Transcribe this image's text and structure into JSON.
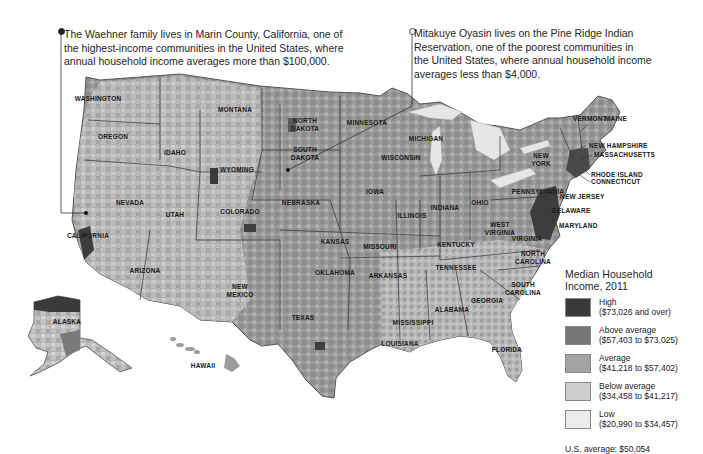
{
  "callouts": {
    "left": {
      "lines": [
        "The Waehner family lives in Marin County, California, one of",
        "the highest-income communities in the United States, where",
        "annual household income averages more than $100,000."
      ],
      "marker": "filled-dot"
    },
    "right": {
      "lines": [
        "Mitakuye Oyasin lives on the Pine Ridge Indian",
        "Reservation, one of the poorest communities in",
        "the United States, where annual household income",
        "averages less than $4,000."
      ],
      "marker": "hollow-dot"
    }
  },
  "map": {
    "states": [
      {
        "name": "WASHINGTON",
        "x": 98,
        "y": 101
      },
      {
        "name": "OREGON",
        "x": 113,
        "y": 139
      },
      {
        "name": "IDAHO",
        "x": 175,
        "y": 155
      },
      {
        "name": "MONTANA",
        "x": 235,
        "y": 112
      },
      {
        "name": "WYOMING",
        "x": 237,
        "y": 172
      },
      {
        "name": "NORTH",
        "x": 305,
        "y": 123
      },
      {
        "name": "DAKOTA",
        "x": 305,
        "y": 131
      },
      {
        "name": "SOUTH",
        "x": 305,
        "y": 152
      },
      {
        "name": "DAKOTA",
        "x": 305,
        "y": 160
      },
      {
        "name": "MINNESOTA",
        "x": 367,
        "y": 125
      },
      {
        "name": "WISCONSIN",
        "x": 401,
        "y": 160
      },
      {
        "name": "MICHIGAN",
        "x": 426,
        "y": 141
      },
      {
        "name": "IOWA",
        "x": 375,
        "y": 194
      },
      {
        "name": "NEBRASKA",
        "x": 301,
        "y": 205
      },
      {
        "name": "NEVADA",
        "x": 130,
        "y": 205
      },
      {
        "name": "UTAH",
        "x": 175,
        "y": 217
      },
      {
        "name": "COLORADO",
        "x": 240,
        "y": 214
      },
      {
        "name": "CALIFORNIA",
        "x": 88,
        "y": 238
      },
      {
        "name": "ILLINOIS",
        "x": 412,
        "y": 218
      },
      {
        "name": "INDIANA",
        "x": 445,
        "y": 210
      },
      {
        "name": "OHIO",
        "x": 480,
        "y": 205
      },
      {
        "name": "KANSAS",
        "x": 335,
        "y": 244
      },
      {
        "name": "MISSOURI",
        "x": 380,
        "y": 249
      },
      {
        "name": "KENTUCKY",
        "x": 456,
        "y": 247
      },
      {
        "name": "WEST",
        "x": 500,
        "y": 227
      },
      {
        "name": "VIRGINIA",
        "x": 500,
        "y": 235
      },
      {
        "name": "VIRGINIA",
        "x": 527,
        "y": 241
      },
      {
        "name": "ARIZONA",
        "x": 145,
        "y": 273
      },
      {
        "name": "OKLAHOMA",
        "x": 335,
        "y": 275
      },
      {
        "name": "ARKANSAS",
        "x": 388,
        "y": 278
      },
      {
        "name": "TENNESSEE",
        "x": 456,
        "y": 270
      },
      {
        "name": "NORTH",
        "x": 533,
        "y": 256
      },
      {
        "name": "CAROLINA",
        "x": 533,
        "y": 264
      },
      {
        "name": "NEW",
        "x": 240,
        "y": 289
      },
      {
        "name": "MEXICO",
        "x": 240,
        "y": 297
      },
      {
        "name": "SOUTH",
        "x": 523,
        "y": 287
      },
      {
        "name": "CAROLINA",
        "x": 523,
        "y": 295
      },
      {
        "name": "GEORGIA",
        "x": 487,
        "y": 303
      },
      {
        "name": "ALABAMA",
        "x": 452,
        "y": 312
      },
      {
        "name": "MISSISSIPPI",
        "x": 413,
        "y": 325
      },
      {
        "name": "TEXAS",
        "x": 303,
        "y": 320
      },
      {
        "name": "LOUISIANA",
        "x": 400,
        "y": 346
      },
      {
        "name": "FLORIDA",
        "x": 507,
        "y": 352
      },
      {
        "name": "ALASKA",
        "x": 67,
        "y": 324
      },
      {
        "name": "HAWAII",
        "x": 203,
        "y": 368
      },
      {
        "name": "PENNSYLVANIA",
        "x": 538,
        "y": 194
      },
      {
        "name": "NEW",
        "x": 541,
        "y": 158
      },
      {
        "name": "YORK",
        "x": 541,
        "y": 166
      }
    ],
    "northeast_labels": [
      {
        "name": "VERMONT",
        "x": 573,
        "y": 121
      },
      {
        "name": "MAINE",
        "x": 605,
        "y": 121
      },
      {
        "name": "NEW HAMPSHIRE",
        "x": 589,
        "y": 148
      },
      {
        "name": "MASSACHUSETTS",
        "x": 594,
        "y": 157
      },
      {
        "name": "RHODE ISLAND",
        "x": 591,
        "y": 177
      },
      {
        "name": "CONNECTICUT",
        "x": 591,
        "y": 184
      },
      {
        "name": "NEW JERSEY",
        "x": 560,
        "y": 199
      },
      {
        "name": "DELAWARE",
        "x": 552,
        "y": 213
      },
      {
        "name": "MARYLAND",
        "x": 559,
        "y": 228
      }
    ]
  },
  "legend": {
    "title_line1": "Median Household",
    "title_line2": "Income, 2011",
    "items": [
      {
        "label": "High",
        "range": "($73,026 and over)",
        "color": "#3a3a3a"
      },
      {
        "label": "Above average",
        "range": "($57,403 to $73,025)",
        "color": "#777777"
      },
      {
        "label": "Average",
        "range": "($41,218 to $57,402)",
        "color": "#a3a3a3"
      },
      {
        "label": "Below average",
        "range": "($34,458 to $41,217)",
        "color": "#cfcfcf"
      },
      {
        "label": "Low",
        "range": "($20,990 to $34,457)",
        "color": "#ececec"
      }
    ],
    "us_average": "U.S. average: $50,054"
  }
}
